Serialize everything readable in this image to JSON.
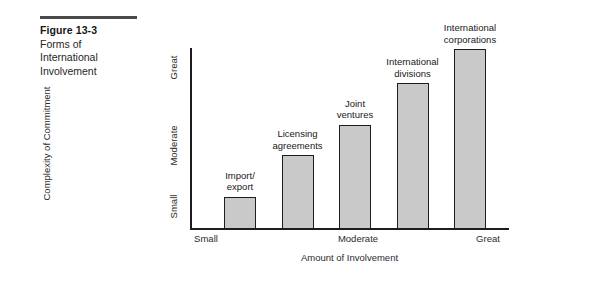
{
  "caption": {
    "number": "Figure 13-3",
    "lines": [
      "Forms of",
      "International",
      "Involvement"
    ]
  },
  "chart_data": {
    "type": "bar",
    "title": "",
    "xlabel": "Amount of Involvement",
    "ylabel": "Complexity of Commitment",
    "categories": [
      "Import/\nexport",
      "Licensing\nagreements",
      "Joint\nventures",
      "International\ndivisions",
      "International\ncorporations"
    ],
    "values": [
      18,
      41,
      58,
      81,
      100
    ],
    "x_tick_labels": [
      "Small",
      "Moderate",
      "Great"
    ],
    "y_tick_labels": [
      "Small",
      "Moderate",
      "Great"
    ],
    "ylim": [
      0,
      100
    ],
    "grid": false,
    "legend": "none",
    "bar_fill_color": "#c9c9c9",
    "bar_edge_color": "#1d1d1d",
    "axis_color": "#1d1d1d",
    "background_color": "#ffffff"
  }
}
